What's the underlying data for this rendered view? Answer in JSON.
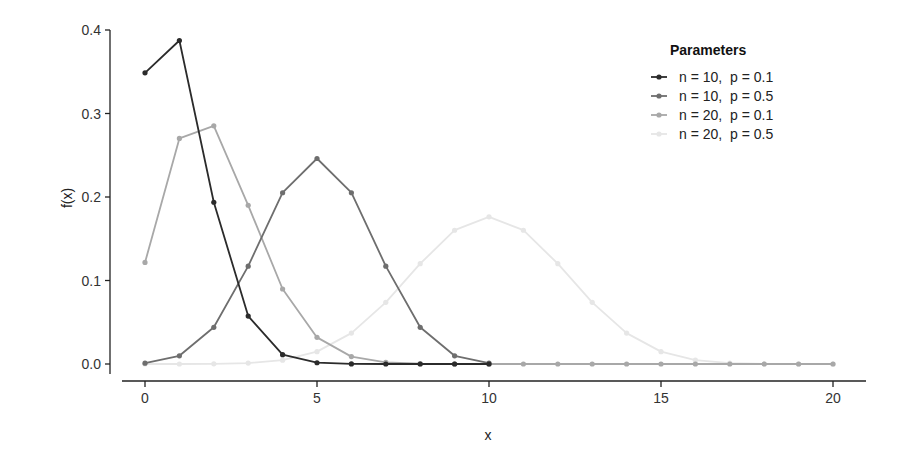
{
  "chart_data": {
    "type": "line",
    "title": "",
    "xlabel": "x",
    "ylabel": "f(x)",
    "xlim": [
      -0.5,
      21
    ],
    "ylim": [
      0,
      0.4
    ],
    "x_ticks": [
      0,
      5,
      10,
      15,
      20
    ],
    "y_ticks": [
      "0.0",
      "0.1",
      "0.2",
      "0.3",
      "0.4"
    ],
    "grid": false,
    "legend": {
      "title": "Parameters",
      "position": "top-right-inside"
    },
    "series": [
      {
        "name": "n = 10,  p = 0.1",
        "color": "#2b2b2b",
        "x": [
          0,
          1,
          2,
          3,
          4,
          5,
          6,
          7,
          8,
          9,
          10
        ],
        "values": [
          0.3487,
          0.3874,
          0.1937,
          0.0574,
          0.0112,
          0.0015,
          0.0001,
          0.0,
          0.0,
          0.0,
          0.0
        ]
      },
      {
        "name": "n = 10,  p = 0.5",
        "color": "#6e6e6e",
        "x": [
          0,
          1,
          2,
          3,
          4,
          5,
          6,
          7,
          8,
          9,
          10
        ],
        "values": [
          0.001,
          0.0098,
          0.0439,
          0.1172,
          0.2051,
          0.2461,
          0.2051,
          0.1172,
          0.0439,
          0.0098,
          0.001
        ]
      },
      {
        "name": "n = 20,  p = 0.1",
        "color": "#a8a8a8",
        "x": [
          0,
          1,
          2,
          3,
          4,
          5,
          6,
          7,
          8,
          9,
          10,
          11,
          12,
          13,
          14,
          15,
          16,
          17,
          18,
          19,
          20
        ],
        "values": [
          0.1216,
          0.2702,
          0.2852,
          0.1901,
          0.0898,
          0.0319,
          0.0089,
          0.002,
          0.0004,
          0.0001,
          0,
          0,
          0,
          0,
          0,
          0,
          0,
          0,
          0,
          0,
          0
        ]
      },
      {
        "name": "n = 20,  p = 0.5",
        "color": "#e6e6e6",
        "x": [
          0,
          1,
          2,
          3,
          4,
          5,
          6,
          7,
          8,
          9,
          10,
          11,
          12,
          13,
          14,
          15,
          16,
          17,
          18,
          19,
          20
        ],
        "values": [
          0.0,
          0.0,
          0.0002,
          0.0011,
          0.0046,
          0.0148,
          0.037,
          0.0739,
          0.1201,
          0.1602,
          0.1762,
          0.1602,
          0.1201,
          0.0739,
          0.037,
          0.0148,
          0.0046,
          0.0011,
          0.0002,
          0.0,
          0.0
        ]
      }
    ]
  }
}
